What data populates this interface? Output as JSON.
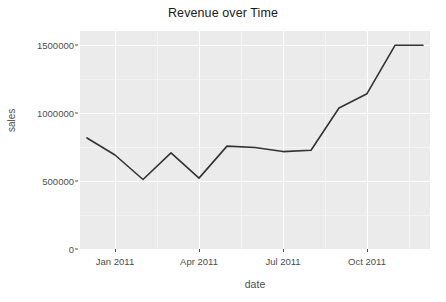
{
  "chart_data": {
    "type": "line",
    "title": "Revenue over Time",
    "xlabel": "date",
    "ylabel": "sales",
    "grid": true,
    "legend": "none",
    "ylim": [
      0,
      1600000
    ],
    "y_ticks": [
      0,
      500000,
      1000000,
      1500000
    ],
    "y_tick_labels": [
      "0",
      "500000",
      "1000000",
      "1500000"
    ],
    "x_ticks": [
      "Jan 2011",
      "Apr 2011",
      "Jul 2011",
      "Oct 2011"
    ],
    "x_tick_labels": [
      "Jan 2011",
      "Apr 2011",
      "Jul 2011",
      "Oct 2011"
    ],
    "x": [
      "2010-12-01",
      "2011-01-01",
      "2011-02-01",
      "2011-03-01",
      "2011-04-01",
      "2011-05-01",
      "2011-06-01",
      "2011-07-01",
      "2011-08-01",
      "2011-09-01",
      "2011-10-01",
      "2011-11-01",
      "2011-12-01"
    ],
    "values": [
      815000,
      690000,
      510000,
      705000,
      520000,
      755000,
      745000,
      715000,
      725000,
      1035000,
      1140000,
      1495000,
      1495000
    ],
    "series": [
      {
        "name": "sales",
        "color": "#333333",
        "values": [
          815000,
          690000,
          510000,
          705000,
          520000,
          755000,
          745000,
          715000,
          725000,
          1035000,
          1140000,
          1495000,
          1495000
        ]
      }
    ],
    "panel_background": "#ebebeb",
    "gridline_color": "#ffffff",
    "line_color": "#333333",
    "line_width": 1.6
  }
}
